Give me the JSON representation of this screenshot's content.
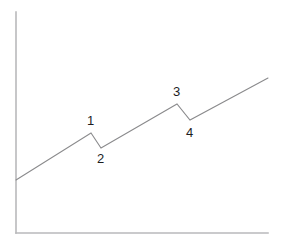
{
  "figure": {
    "background_color": "#ffffff",
    "width": 281,
    "height": 245
  },
  "axes": {
    "axis_color": "#b9b9bb",
    "y_axis": {
      "name": "y-axis",
      "x": 16,
      "y_top": 12,
      "y_bottom": 233
    },
    "x_axis": {
      "name": "x-axis",
      "y": 233,
      "x_left": 16,
      "x_right": 268
    },
    "ticks": [],
    "tick_labels": [],
    "xlabel": "",
    "ylabel": "",
    "grid": false
  },
  "chart_data": {
    "type": "line",
    "title": "",
    "subtitle": "",
    "xlabel": "",
    "ylabel": "",
    "grid": false,
    "legend": null,
    "legend_position": "none",
    "line_color": "#8a8a8c",
    "axis_color": "#b9b9bb",
    "xlim": [
      16,
      268
    ],
    "ylim": [
      233,
      12
    ],
    "series": [
      {
        "name": "trend",
        "points": [
          {
            "x": 16,
            "y": 180
          },
          {
            "x": 91,
            "y": 133
          },
          {
            "x": 101,
            "y": 148
          },
          {
            "x": 177,
            "y": 104
          },
          {
            "x": 190,
            "y": 120
          },
          {
            "x": 268,
            "y": 78
          }
        ]
      }
    ],
    "annotations": [
      {
        "label": "1",
        "point_x": 91,
        "point_y": 133,
        "label_x": 87,
        "label_y": 114,
        "position": "above"
      },
      {
        "label": "2",
        "point_x": 101,
        "point_y": 148,
        "label_x": 97,
        "label_y": 152,
        "position": "below"
      },
      {
        "label": "3",
        "point_x": 177,
        "point_y": 104,
        "label_x": 173,
        "label_y": 85,
        "position": "above"
      },
      {
        "label": "4",
        "point_x": 190,
        "point_y": 120,
        "label_x": 186,
        "label_y": 126,
        "position": "below"
      }
    ]
  }
}
